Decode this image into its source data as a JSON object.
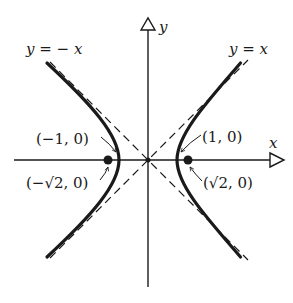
{
  "figure": {
    "origin_px": [
      148,
      160
    ],
    "unit_px": 29,
    "colors": {
      "ink": "#1a1a1a",
      "background": "#ffffff"
    },
    "axes": {
      "x_label": "x",
      "y_label": "y"
    },
    "asymptotes": [
      {
        "label": "y = x",
        "slope": 1
      },
      {
        "label": "y = − x",
        "slope": -1
      }
    ],
    "points": [
      {
        "label": "(1, 0)",
        "x": 1,
        "y": 0,
        "kind": "vertex"
      },
      {
        "label": "(−1, 0)",
        "x": -1,
        "y": 0,
        "kind": "vertex"
      },
      {
        "label": "(√2, 0)",
        "x": 1.414,
        "y": 0,
        "kind": "focus"
      },
      {
        "label": "(−√2, 0)",
        "x": -1.414,
        "y": 0,
        "kind": "focus"
      }
    ]
  }
}
